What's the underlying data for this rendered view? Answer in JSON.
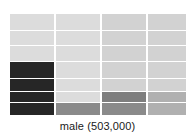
{
  "chart_data": {
    "type": "heatmap",
    "title": "",
    "xlabel": "male (503,000)",
    "ylabel": "",
    "grid": true,
    "legend": "none",
    "background": "#ffffff",
    "gridline_color": "#ffffff",
    "columns": [
      {
        "name": "col-1",
        "x_start": 0,
        "x_width": 44
      },
      {
        "name": "col-2",
        "x_start": 46,
        "x_width": 44
      },
      {
        "name": "col-3",
        "x_start": 92,
        "x_width": 44
      },
      {
        "name": "col-4",
        "x_start": 138,
        "x_width": 38
      }
    ],
    "rows": [
      {
        "name": "row-1",
        "y_start": 0,
        "y_height": 16
      },
      {
        "name": "row-2",
        "y_start": 17,
        "y_height": 14
      },
      {
        "name": "row-3",
        "y_start": 32,
        "y_height": 15
      },
      {
        "name": "row-4",
        "y_start": 48,
        "y_height": 16
      },
      {
        "name": "row-5",
        "y_start": 65,
        "y_height": 12
      },
      {
        "name": "row-6",
        "y_start": 78,
        "y_height": 10
      },
      {
        "name": "row-7",
        "y_start": 89,
        "y_height": 12
      }
    ],
    "cells": [
      {
        "col": 0,
        "row": 0,
        "color": "#dcdcdc"
      },
      {
        "col": 0,
        "row": 1,
        "color": "#dcdcdc"
      },
      {
        "col": 0,
        "row": 2,
        "color": "#dcdcdc"
      },
      {
        "col": 0,
        "row": 3,
        "color": "#262626"
      },
      {
        "col": 0,
        "row": 4,
        "color": "#262626"
      },
      {
        "col": 0,
        "row": 5,
        "color": "#262626"
      },
      {
        "col": 0,
        "row": 6,
        "color": "#262626"
      },
      {
        "col": 1,
        "row": 0,
        "color": "#dcdcdc"
      },
      {
        "col": 1,
        "row": 1,
        "color": "#dcdcdc"
      },
      {
        "col": 1,
        "row": 2,
        "color": "#dcdcdc"
      },
      {
        "col": 1,
        "row": 3,
        "color": "#dcdcdc"
      },
      {
        "col": 1,
        "row": 4,
        "color": "#dcdcdc"
      },
      {
        "col": 1,
        "row": 5,
        "color": "#dcdcdc"
      },
      {
        "col": 1,
        "row": 6,
        "color": "#8a8a8a"
      },
      {
        "col": 2,
        "row": 0,
        "color": "#d2d2d2"
      },
      {
        "col": 2,
        "row": 1,
        "color": "#d2d2d2"
      },
      {
        "col": 2,
        "row": 2,
        "color": "#d2d2d2"
      },
      {
        "col": 2,
        "row": 3,
        "color": "#d2d2d2"
      },
      {
        "col": 2,
        "row": 4,
        "color": "#d2d2d2"
      },
      {
        "col": 2,
        "row": 5,
        "color": "#7e7e7e"
      },
      {
        "col": 2,
        "row": 6,
        "color": "#8a8a8a"
      },
      {
        "col": 3,
        "row": 0,
        "color": "#d2d2d2"
      },
      {
        "col": 3,
        "row": 1,
        "color": "#d2d2d2"
      },
      {
        "col": 3,
        "row": 2,
        "color": "#d2d2d2"
      },
      {
        "col": 3,
        "row": 3,
        "color": "#d2d2d2"
      },
      {
        "col": 3,
        "row": 4,
        "color": "#d2d2d2"
      },
      {
        "col": 3,
        "row": 5,
        "color": "#b0b0b0"
      },
      {
        "col": 3,
        "row": 6,
        "color": "#b0b0b0"
      }
    ],
    "annotations": []
  },
  "axis": {
    "x_label": "male (503,000)"
  }
}
